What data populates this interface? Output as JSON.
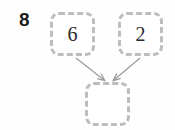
{
  "diagram": {
    "question_label": "8",
    "nodes": [
      {
        "id": "top-left",
        "value": "6",
        "empty": false
      },
      {
        "id": "top-right",
        "value": "2",
        "empty": false
      },
      {
        "id": "bottom",
        "value": "",
        "empty": true
      }
    ],
    "edges": [
      {
        "from": "top-left",
        "to": "bottom",
        "arrowhead": true
      },
      {
        "from": "top-right",
        "to": "bottom",
        "arrowhead": true
      }
    ],
    "colors": {
      "border": "#bdbdbd",
      "arrow": "#9a9a9a",
      "text": "#2a2a2a",
      "label": "#1d1d1d",
      "background": "#fefefe"
    }
  }
}
